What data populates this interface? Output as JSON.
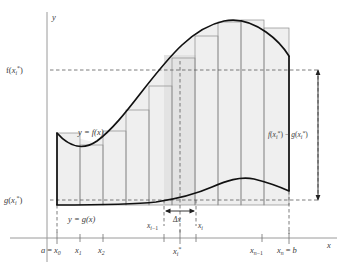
{
  "figure": {
    "axes": {
      "y_axis_label": "y",
      "x_axis_label": "x"
    },
    "y_axis_ticks": [
      {
        "id": "f-star",
        "label_parts": [
          "f(x",
          "i",
          "*",
          ")"
        ],
        "label": "f(xi*)",
        "y_px": 70
      },
      {
        "id": "g-star",
        "label_parts": [
          "g(x",
          "i",
          "*",
          ")"
        ],
        "label": "g(xi*)",
        "y_px": 200
      }
    ],
    "x_axis_ticks": [
      {
        "id": "x0",
        "label": "a = x0",
        "x_px": 57
      },
      {
        "id": "x1",
        "label": "x1",
        "x_px": 80
      },
      {
        "id": "x2",
        "label": "x2",
        "x_px": 103
      },
      {
        "id": "xi-1",
        "label": "xi-1",
        "x_px": 164
      },
      {
        "id": "xi-star",
        "label": "xi*",
        "x_px": 180
      },
      {
        "id": "xi",
        "label": "xi",
        "x_px": 196
      },
      {
        "id": "xn-1",
        "label": "xn-1",
        "x_px": 262
      },
      {
        "id": "xn",
        "label": "xn = b",
        "x_px": 289
      }
    ],
    "curve_labels": {
      "upper": "y = f(x)",
      "lower": "y = g(x)"
    },
    "annotations": {
      "delta_x": "Δx",
      "height_difference": "f(xi*) - g(xi*)"
    },
    "colors": {
      "curve": "#1a1a1a",
      "rect_stroke": "#8a8a8a",
      "fill": "#efefef",
      "fill_highlight": "#e2e2e2",
      "dashed": "#4d4d4d",
      "axis": "#9a9a9a",
      "text": "#3a3a3a"
    },
    "rectangle_count": 10
  }
}
